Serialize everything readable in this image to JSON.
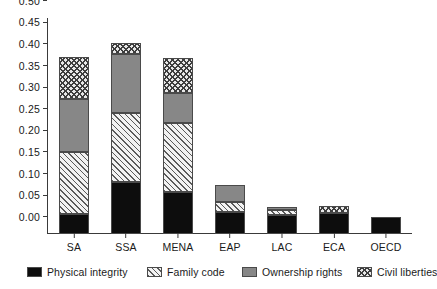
{
  "chart_data": {
    "type": "bar",
    "stacked": true,
    "title": "",
    "subtitle": "",
    "xlabel": "",
    "ylabel": "",
    "categories": [
      "SA",
      "SSA",
      "MENA",
      "EAP",
      "LAC",
      "ECA",
      "OECD"
    ],
    "series": [
      {
        "name": "Physical integrity",
        "color": "#0d0d0d",
        "pattern": "solid-black",
        "values": [
          0.047,
          0.12,
          0.098,
          0.05,
          0.045,
          0.048,
          0.04
        ]
      },
      {
        "name": "Family code",
        "color": "#f2f2f2",
        "pattern": "diagonal-hatch-light",
        "values": [
          0.143,
          0.16,
          0.16,
          0.023,
          0.01,
          0.0,
          0.0
        ]
      },
      {
        "name": "Ownership rights",
        "color": "#878787",
        "pattern": "solid-gray",
        "values": [
          0.122,
          0.137,
          0.069,
          0.04,
          0.008,
          0.0,
          0.0
        ]
      },
      {
        "name": "Civil liberties",
        "color": "#e8e8e8",
        "pattern": "cross-hatch-dark",
        "values": [
          0.098,
          0.026,
          0.081,
          0.0,
          0.0,
          0.018,
          0.0
        ]
      }
    ],
    "totals": [
      0.41,
      0.443,
      0.408,
      0.113,
      0.063,
      0.066,
      0.04
    ],
    "ylim": [
      0.0,
      0.5
    ],
    "ytick_step": 0.05,
    "yticks": [
      "0.00",
      "0.05",
      "0.10",
      "0.15",
      "0.20",
      "0.25",
      "0.30",
      "0.35",
      "0.40",
      "0.45",
      "0.50"
    ],
    "ytick_values": [
      0.0,
      0.05,
      0.1,
      0.15,
      0.2,
      0.25,
      0.3,
      0.35,
      0.4,
      0.45,
      0.5
    ],
    "grid": false,
    "legend_position": "bottom",
    "legend": [
      "Physical integrity",
      "Family code",
      "Ownership rights",
      "Civil liberties"
    ]
  }
}
